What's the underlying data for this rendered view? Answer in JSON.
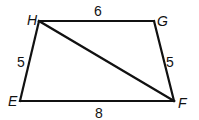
{
  "figure": {
    "type": "trapezoid",
    "stroke_color": "#111111",
    "vertices": [
      {
        "name": "H",
        "x": 39,
        "y": 21,
        "label_x": 27,
        "label_y": 25
      },
      {
        "name": "G",
        "x": 154,
        "y": 21,
        "label_x": 157,
        "label_y": 26
      },
      {
        "name": "F",
        "x": 174,
        "y": 101,
        "label_x": 178,
        "label_y": 108
      },
      {
        "name": "E",
        "x": 20,
        "y": 101,
        "label_x": 8,
        "label_y": 106
      }
    ],
    "sides": [
      {
        "from": "H",
        "to": "G",
        "length": "6",
        "label_x": 97,
        "label_y": 16
      },
      {
        "from": "G",
        "to": "F",
        "length": "5",
        "label_x": 168,
        "label_y": 66
      },
      {
        "from": "F",
        "to": "E",
        "length": "8",
        "label_x": 99,
        "label_y": 117
      },
      {
        "from": "E",
        "to": "H",
        "length": "5",
        "label_x": 18,
        "label_y": 66
      }
    ],
    "diagonals": [
      {
        "from": "H",
        "to": "F"
      }
    ]
  }
}
